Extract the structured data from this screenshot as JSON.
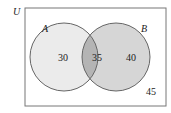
{
  "diagram": {
    "type": "venn",
    "universe_label": "U",
    "sets": [
      {
        "label": "A",
        "only_value": "30",
        "fill": "#ebebeb"
      },
      {
        "label": "B",
        "only_value": "40",
        "fill": "#d6d6d6"
      }
    ],
    "intersection_value": "35",
    "intersection_fill": "#b4b4b4",
    "outside_value": "45",
    "stroke": "#666666"
  }
}
